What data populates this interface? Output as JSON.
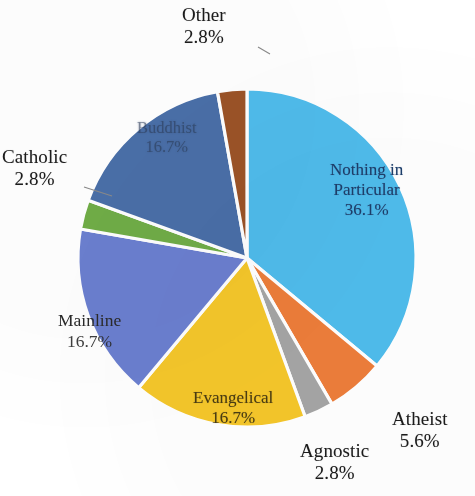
{
  "chart_data": {
    "type": "pie",
    "title": "",
    "subtitle": "",
    "xlabel": "",
    "ylabel": "",
    "legend_position": "none",
    "grid": false,
    "units": "percent",
    "total": 100.0,
    "start_angle_deg": 0,
    "direction": "clockwise",
    "categories": [
      "Nothing in Particular",
      "Atheist",
      "Agnostic",
      "Evangelical",
      "Mainline",
      "Catholic",
      "Buddhist",
      "Other"
    ],
    "values": [
      36.1,
      5.6,
      2.8,
      16.7,
      16.7,
      2.8,
      16.7,
      2.8
    ],
    "colors": [
      "#4FBCEC",
      "#ED7D3A",
      "#A5A5A5",
      "#F5C72A",
      "#6B7FD0",
      "#70AD47",
      "#4A6FA8",
      "#9C5327"
    ],
    "slices": [
      {
        "label": "Nothing in Particular",
        "label_line1": "Nothing in",
        "label_line2": "Particular",
        "value": 36.1,
        "value_text": "36.1%",
        "color": "#4FBCEC",
        "color_name": "light-blue",
        "label_placement": "inside"
      },
      {
        "label": "Atheist",
        "value": 5.6,
        "value_text": "5.6%",
        "color": "#ED7D3A",
        "color_name": "orange",
        "label_placement": "outside"
      },
      {
        "label": "Agnostic",
        "value": 2.8,
        "value_text": "2.8%",
        "color": "#A5A5A5",
        "color_name": "gray",
        "label_placement": "outside"
      },
      {
        "label": "Evangelical",
        "value": 16.7,
        "value_text": "16.7%",
        "color": "#F5C72A",
        "color_name": "yellow",
        "label_placement": "inside"
      },
      {
        "label": "Mainline",
        "value": 16.7,
        "value_text": "16.7%",
        "color": "#6B7FD0",
        "color_name": "medium-blue",
        "label_placement": "outside"
      },
      {
        "label": "Catholic",
        "value": 2.8,
        "value_text": "2.8%",
        "color": "#70AD47",
        "color_name": "green",
        "label_placement": "outside"
      },
      {
        "label": "Buddhist",
        "value": 16.7,
        "value_text": "16.7%",
        "color": "#4A6FA8",
        "color_name": "dark-slate-blue",
        "label_placement": "inside"
      },
      {
        "label": "Other",
        "value": 2.8,
        "value_text": "2.8%",
        "color": "#9C5327",
        "color_name": "brown",
        "label_placement": "outside"
      }
    ]
  },
  "labels": {
    "other": {
      "name": "Other",
      "pct": "2.8%"
    },
    "catholic": {
      "name": "Catholic",
      "pct": "2.8%"
    },
    "mainline": {
      "name": "Mainline",
      "pct": "16.7%"
    },
    "evangelical": {
      "name": "Evangelical",
      "pct": "16.7%"
    },
    "agnostic": {
      "name": "Agnostic",
      "pct": "2.8%"
    },
    "atheist": {
      "name": "Atheist",
      "pct": "5.6%"
    },
    "nothing": {
      "line1": "Nothing in",
      "line2": "Particular",
      "pct": "36.1%"
    },
    "buddhist": {
      "name": "Buddhist",
      "pct": "16.7%"
    }
  },
  "style": {
    "slice_border_color": "#ffffff",
    "background": "#ffffff",
    "leader_line_color": "#8a8a8a"
  }
}
